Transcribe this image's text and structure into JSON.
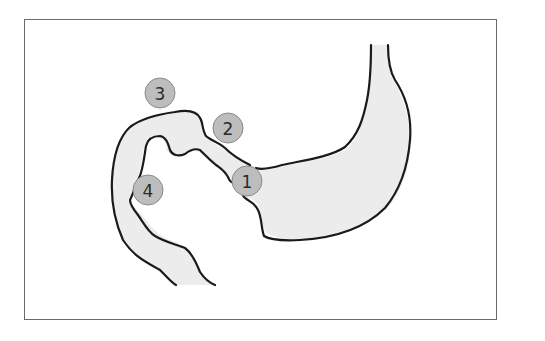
{
  "diagram": {
    "colors": {
      "frame_border": "#6a6a6a",
      "outline": "#1a1a1a",
      "organ_fill": "#ececec",
      "marker_fill": "#bdbdbd",
      "marker_stroke": "#8a8a8a",
      "marker_text": "#2a2a2a"
    },
    "markers": [
      {
        "label": "1",
        "cx": 247,
        "cy": 181,
        "r": 15
      },
      {
        "label": "2",
        "cx": 228,
        "cy": 128,
        "r": 15
      },
      {
        "label": "3",
        "cx": 160,
        "cy": 93,
        "r": 15
      },
      {
        "label": "4",
        "cx": 148,
        "cy": 190,
        "r": 15
      }
    ]
  }
}
